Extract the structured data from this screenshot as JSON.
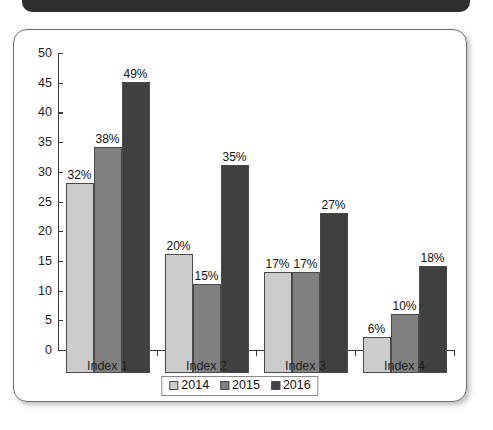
{
  "banner": {
    "name": "top-dark-banner",
    "color": "#2f2f2f"
  },
  "card": {
    "border_color": "#6f6f6f",
    "background": "#ffffff"
  },
  "chart_data": {
    "type": "bar",
    "title": "",
    "subtitle": "",
    "xlabel": "",
    "ylabel": "",
    "categories": [
      "Index 1",
      "Index 2",
      "Index 3",
      "Index 4"
    ],
    "series": [
      {
        "name": "2014",
        "color": "#cccccc",
        "values": [
          32,
          20,
          17,
          6
        ],
        "labels": [
          "32%",
          "20%",
          "17%",
          "6%"
        ]
      },
      {
        "name": "2015",
        "color": "#808080",
        "values": [
          38,
          15,
          17,
          10
        ],
        "labels": [
          "38%",
          "15%",
          "17%",
          "10%"
        ]
      },
      {
        "name": "2016",
        "color": "#404040",
        "values": [
          49,
          35,
          27,
          18
        ],
        "labels": [
          "49%",
          "35%",
          "27%",
          "18%"
        ]
      }
    ],
    "ylim": [
      0,
      50
    ],
    "yticks": [
      0,
      5,
      10,
      15,
      20,
      25,
      30,
      35,
      40,
      45,
      50
    ],
    "ytick_labels": [
      "0",
      "5",
      "10",
      "15",
      "20",
      "25",
      "30",
      "35",
      "40",
      "45",
      "50"
    ],
    "grid": false,
    "legend_position": "bottom",
    "value_labels": true,
    "axis_color": "#3b3b3b"
  }
}
